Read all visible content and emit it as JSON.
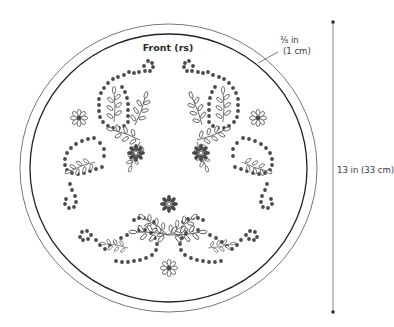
{
  "diagram": {
    "title": "Front (rs)",
    "seam_allowance": {
      "line1": "⅜ in",
      "line2": "(1 cm)"
    },
    "diameter_label": "13 in (33 cm)",
    "colors": {
      "outline": "#3a3a3a",
      "dots": "#4a4a4a",
      "background": "#ffffff"
    },
    "elements": [
      "outer-cutting-circle",
      "inner-stitching-circle",
      "paisley-dot-motifs",
      "daisy-flowers",
      "leaf-sprays",
      "vertical-dimension-line"
    ]
  }
}
